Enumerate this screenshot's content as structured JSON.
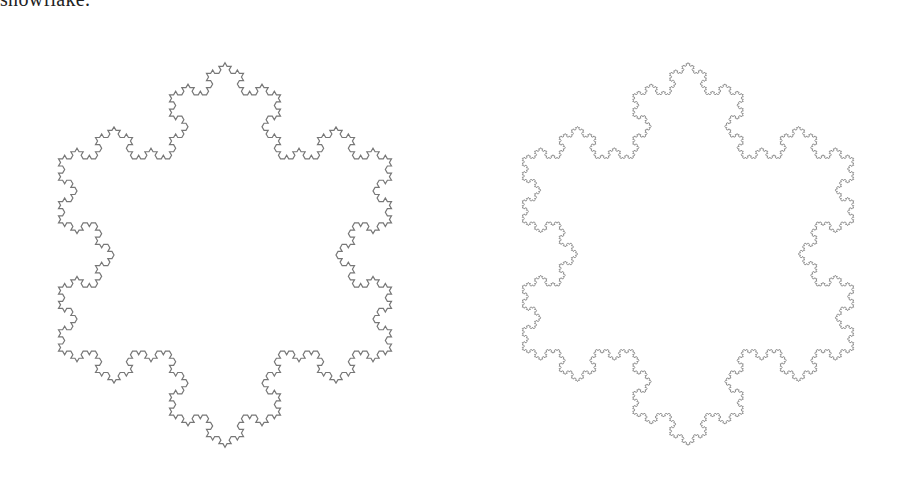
{
  "caption": {
    "text": "snowflake."
  },
  "figures": [
    {
      "name": "koch-snowflake-level-4",
      "center": [
        225,
        255
      ],
      "radius": 222,
      "iterations": 4,
      "stroke_color": "#777777",
      "stroke_width": 1.2
    },
    {
      "name": "koch-snowflake-level-5",
      "center": [
        688,
        254
      ],
      "radius": 221,
      "iterations": 5,
      "stroke_color": "#888888",
      "stroke_width": 0.9
    }
  ],
  "background_color": "#ffffff"
}
